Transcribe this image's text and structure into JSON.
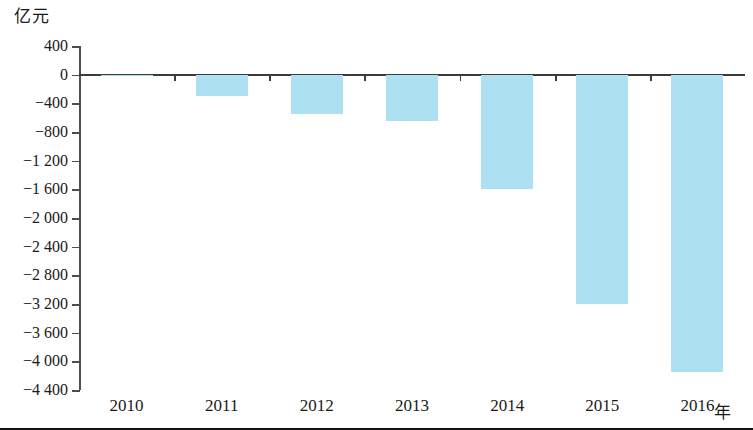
{
  "chart_data": {
    "type": "bar",
    "title": "",
    "subtitle": "",
    "ylabel": "亿元",
    "xlabel": "年",
    "categories": [
      "2010",
      "2011",
      "2012",
      "2013",
      "2014",
      "2015",
      "2016"
    ],
    "values": [
      -10,
      -300,
      -550,
      -650,
      -1600,
      -3200,
      -4150
    ],
    "ylim": [
      -4400,
      400
    ],
    "ytick_step": 400,
    "ytick_labels": [
      "400",
      "0",
      "−400",
      "−800",
      "−1 200",
      "−1 600",
      "−2 000",
      "−2 400",
      "−2 800",
      "−3 200",
      "−3 600",
      "−4 000",
      "−4 400"
    ],
    "ytick_values": [
      400,
      0,
      -400,
      -800,
      -1200,
      -1600,
      -2000,
      -2400,
      -2800,
      -3200,
      -3600,
      -4000,
      -4400
    ],
    "grid": false,
    "legend": null,
    "series": [
      {
        "name": "亿元",
        "color": "#ade1f2",
        "values": [
          -10,
          -300,
          -550,
          -650,
          -1600,
          -3200,
          -4150
        ]
      }
    ],
    "colors": {
      "bar": "#ade1f2",
      "axis": "#3b3b3b",
      "text": "#1a1a1a",
      "background": "#ffffff"
    }
  }
}
